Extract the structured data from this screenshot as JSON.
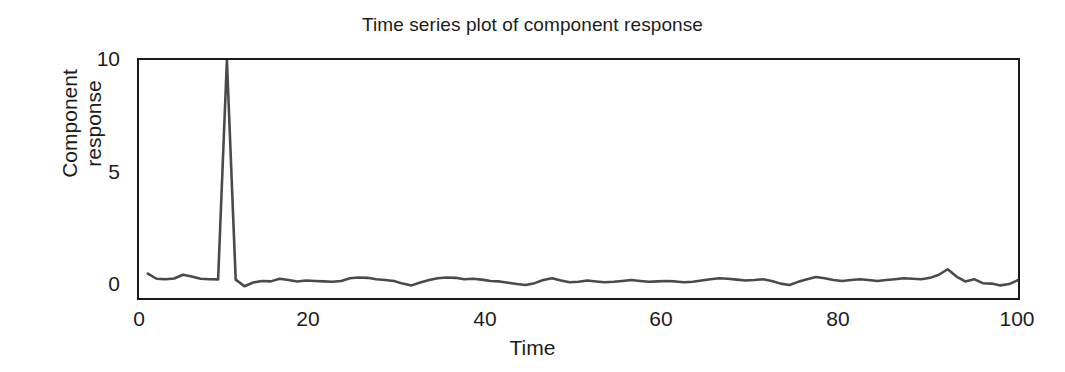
{
  "chart_data": {
    "type": "line",
    "title": "Time series plot of component response",
    "xlabel": "Time",
    "ylabel": "Component response",
    "ylabel_line1": "Component",
    "ylabel_line2": "response",
    "xlim": [
      0,
      100
    ],
    "ylim": [
      -0.75,
      10
    ],
    "xticks": [
      0,
      20,
      40,
      60,
      80,
      100
    ],
    "xtick_labels": [
      "0",
      "20",
      "40",
      "60",
      "80",
      "100"
    ],
    "yticks": [
      0,
      5,
      10
    ],
    "ytick_labels": [
      "0",
      "5",
      "10"
    ],
    "grid": false,
    "legend": null,
    "line_color": "#4a4a4a",
    "line_width": 2.6,
    "annotations": [
      {
        "text": "spike",
        "x": 10,
        "y": 10
      }
    ],
    "series": [
      {
        "name": "Component response",
        "x": [
          1,
          2,
          3,
          4,
          5,
          6,
          7,
          8,
          9,
          10,
          11,
          12,
          13,
          14,
          15,
          16,
          17,
          18,
          19,
          20,
          21,
          22,
          23,
          24,
          25,
          26,
          27,
          28,
          29,
          30,
          31,
          32,
          33,
          34,
          35,
          36,
          37,
          38,
          39,
          40,
          41,
          42,
          43,
          44,
          45,
          46,
          47,
          48,
          49,
          50,
          51,
          52,
          53,
          54,
          55,
          56,
          57,
          58,
          59,
          60,
          61,
          62,
          63,
          64,
          65,
          66,
          67,
          68,
          69,
          70,
          71,
          72,
          73,
          74,
          75,
          76,
          77,
          78,
          79,
          80,
          81,
          82,
          83,
          84,
          85,
          86,
          87,
          88,
          89,
          90,
          91,
          92,
          93,
          94,
          95,
          96,
          97,
          98,
          99,
          100
        ],
        "y": [
          0.35,
          0.12,
          0.1,
          0.13,
          0.3,
          0.22,
          0.12,
          0.1,
          0.09,
          10.0,
          0.08,
          -0.22,
          -0.05,
          0.02,
          0.0,
          0.12,
          0.06,
          0.0,
          0.04,
          0.02,
          0.0,
          -0.02,
          0.02,
          0.14,
          0.18,
          0.16,
          0.1,
          0.06,
          0.02,
          -0.1,
          -0.18,
          -0.05,
          0.06,
          0.14,
          0.18,
          0.16,
          0.1,
          0.12,
          0.08,
          0.02,
          0.0,
          -0.06,
          -0.12,
          -0.16,
          -0.08,
          0.06,
          0.14,
          0.04,
          -0.04,
          -0.02,
          0.04,
          0.0,
          -0.04,
          -0.02,
          0.02,
          0.06,
          0.02,
          -0.02,
          0.0,
          0.02,
          0.0,
          -0.04,
          -0.02,
          0.04,
          0.1,
          0.14,
          0.12,
          0.08,
          0.04,
          0.06,
          0.1,
          0.02,
          -0.1,
          -0.16,
          -0.02,
          0.1,
          0.2,
          0.14,
          0.06,
          0.02,
          0.06,
          0.1,
          0.06,
          0.02,
          0.06,
          0.1,
          0.14,
          0.12,
          0.1,
          0.16,
          0.3,
          0.55,
          0.22,
          0.0,
          0.1,
          -0.08,
          -0.1,
          -0.18,
          -0.12,
          0.06
        ]
      }
    ]
  },
  "figure": {
    "background": "#ffffff",
    "frame_color": "#1a1a1a",
    "text_color": "#1c1c1c"
  }
}
